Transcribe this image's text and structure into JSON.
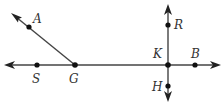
{
  "diagram": {
    "type": "geometry-lines-rays",
    "colors": {
      "line": "#444444",
      "point": "#111111",
      "label": "#333333",
      "background": "#ffffff"
    },
    "points": {
      "A": {
        "label": "A",
        "x": 29,
        "y": 27
      },
      "S": {
        "label": "S",
        "x": 37,
        "y": 65
      },
      "G": {
        "label": "G",
        "x": 75,
        "y": 65
      },
      "K": {
        "label": "K",
        "x": 168,
        "y": 65
      },
      "B": {
        "label": "B",
        "x": 195,
        "y": 65
      },
      "R": {
        "label": "R",
        "x": 168,
        "y": 25
      },
      "H": {
        "label": "H",
        "x": 168,
        "y": 86
      }
    },
    "elements": [
      {
        "kind": "line",
        "through": [
          "S",
          "B"
        ],
        "description": "horizontal line with arrows at both ends"
      },
      {
        "kind": "ray",
        "from": "G",
        "through": "A",
        "description": "ray GA pointing up-left"
      },
      {
        "kind": "line",
        "through": [
          "R",
          "H"
        ],
        "description": "vertical line through K with arrows at both ends"
      }
    ],
    "labels": [
      "A",
      "S",
      "G",
      "K",
      "B",
      "R",
      "H"
    ]
  }
}
